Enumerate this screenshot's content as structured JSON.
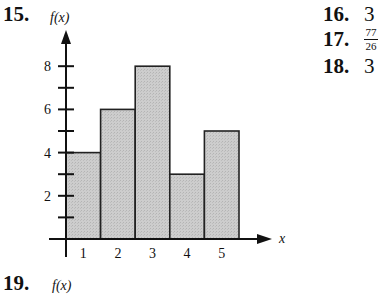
{
  "problems": {
    "p15": {
      "number": "15.",
      "ylabel": "f(x)",
      "xlabel": "x"
    },
    "p16": {
      "number": "16.",
      "answer": "3"
    },
    "p17": {
      "number": "17.",
      "answer_numerator": "77",
      "answer_denominator": "26"
    },
    "p18": {
      "number": "18.",
      "answer": "3"
    },
    "p19": {
      "number": "19.",
      "ylabel": "f(x)"
    }
  },
  "chart_data": {
    "type": "bar",
    "title": "",
    "categories": [
      "1",
      "2",
      "3",
      "4",
      "5"
    ],
    "values": [
      4,
      6,
      8,
      3,
      5
    ],
    "xlabel": "x",
    "ylabel": "f(x)",
    "ylim": [
      0,
      9
    ],
    "yticks_labeled": [
      "2",
      "4",
      "6",
      "8"
    ],
    "yticks_minor": [
      1,
      3,
      5,
      7
    ],
    "grid": false,
    "bar_fill": "#c8c8c8",
    "bar_edge": "#222222",
    "histogram_style": "adjacent bars, no gaps"
  }
}
